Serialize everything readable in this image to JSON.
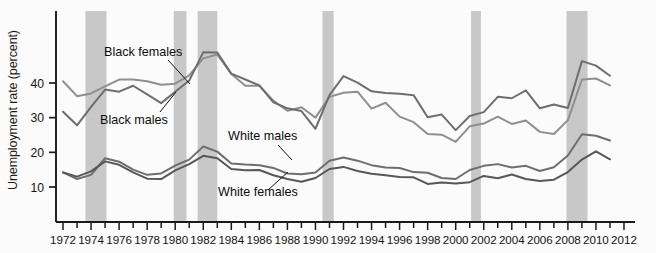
{
  "chart_data": {
    "type": "line",
    "title": "",
    "xlabel": "",
    "ylabel": "Unemployment rate (percent)",
    "xlim": [
      1971.5,
      2012.5
    ],
    "ylim": [
      0,
      50
    ],
    "yticks": [
      10,
      20,
      30,
      40
    ],
    "ytick_labels": [
      "10",
      "20",
      "30",
      "40"
    ],
    "xticks": [
      1972,
      1973,
      1974,
      1975,
      1976,
      1977,
      1978,
      1979,
      1980,
      1981,
      1982,
      1983,
      1984,
      1985,
      1986,
      1987,
      1988,
      1989,
      1990,
      1991,
      1992,
      1993,
      1994,
      1995,
      1996,
      1997,
      1998,
      1999,
      2000,
      2001,
      2002,
      2003,
      2004,
      2005,
      2006,
      2007,
      2008,
      2009,
      2010,
      2011,
      2012
    ],
    "xtick_labels": [
      "1972",
      "1974",
      "1976",
      "1978",
      "1980",
      "1982",
      "1984",
      "1986",
      "1988",
      "1990",
      "1992",
      "1994",
      "1996",
      "1998",
      "2000",
      "2002",
      "2004",
      "2006",
      "2008",
      "2010",
      "2012"
    ],
    "xtick_labeled_years": [
      1972,
      1974,
      1976,
      1978,
      1980,
      1982,
      1984,
      1986,
      1988,
      1990,
      1992,
      1994,
      1996,
      1998,
      2000,
      2002,
      2004,
      2006,
      2008,
      2010,
      2012
    ],
    "grid": false,
    "legend_position": "inline-annotations",
    "x": [
      1972,
      1973,
      1974,
      1975,
      1976,
      1977,
      1978,
      1979,
      1980,
      1981,
      1982,
      1983,
      1984,
      1985,
      1986,
      1987,
      1988,
      1989,
      1990,
      1991,
      1992,
      1993,
      1994,
      1995,
      1996,
      1997,
      1998,
      1999,
      2000,
      2001,
      2002,
      2003,
      2004,
      2005,
      2006,
      2007,
      2008,
      2009,
      2010,
      2011
    ],
    "series": [
      {
        "name": "Black females",
        "color": "#8f8f8f",
        "label_text": "Black females",
        "values": [
          40.5,
          36.2,
          37.0,
          39.0,
          41.0,
          41.0,
          40.5,
          39.5,
          39.8,
          42.2,
          47.1,
          48.2,
          42.6,
          39.2,
          39.2,
          34.9,
          32.0,
          33.0,
          30.0,
          36.0,
          37.2,
          37.5,
          32.6,
          34.3,
          30.3,
          28.7,
          25.3,
          25.1,
          23.0,
          27.5,
          28.3,
          30.3,
          28.2,
          29.2,
          25.9,
          25.3,
          29.3,
          41.0,
          41.3,
          39.3
        ]
      },
      {
        "name": "Black males",
        "color": "#6e6e6e",
        "label_text": "Black males",
        "values": [
          31.7,
          27.8,
          33.1,
          38.1,
          37.5,
          39.2,
          36.7,
          34.2,
          37.5,
          40.7,
          48.9,
          48.8,
          42.7,
          41.0,
          39.3,
          34.4,
          32.7,
          31.9,
          26.8,
          36.5,
          42.0,
          40.1,
          37.6,
          37.1,
          36.9,
          36.5,
          30.1,
          30.9,
          26.4,
          30.5,
          31.6,
          36.0,
          35.6,
          37.9,
          32.7,
          33.8,
          32.8,
          46.3,
          45.0,
          42.1
        ]
      },
      {
        "name": "White males",
        "color": "#6e6e6e",
        "label_text": "White males",
        "values": [
          14.2,
          12.3,
          13.5,
          18.3,
          17.3,
          15.0,
          13.5,
          13.9,
          16.2,
          17.9,
          21.7,
          20.2,
          16.8,
          16.5,
          16.3,
          15.5,
          13.9,
          13.7,
          14.2,
          17.6,
          18.5,
          17.6,
          16.3,
          15.6,
          15.5,
          14.3,
          14.1,
          12.6,
          12.3,
          14.9,
          16.1,
          16.6,
          15.6,
          16.1,
          14.6,
          15.7,
          19.1,
          25.2,
          24.8,
          23.4
        ]
      },
      {
        "name": "White females",
        "color": "#575757",
        "label_text": "White females",
        "values": [
          14.2,
          13.0,
          14.5,
          17.4,
          16.4,
          14.2,
          12.4,
          12.3,
          14.8,
          16.6,
          19.0,
          18.3,
          15.2,
          14.8,
          14.9,
          13.4,
          12.3,
          11.5,
          12.6,
          15.2,
          15.8,
          14.6,
          13.8,
          13.4,
          12.9,
          12.8,
          10.9,
          11.3,
          11.0,
          11.4,
          13.2,
          12.5,
          13.6,
          12.3,
          11.7,
          12.1,
          14.3,
          17.9,
          20.3,
          18.0
        ]
      }
    ],
    "recession_bands": [
      {
        "label": "1973-75 recession",
        "start": 1973.6,
        "end": 1975.1
      },
      {
        "label": "1980 recession",
        "start": 1979.9,
        "end": 1980.8
      },
      {
        "label": "1981-82 recession",
        "start": 1981.6,
        "end": 1983.0
      },
      {
        "label": "1990-91 recession",
        "start": 1990.5,
        "end": 1991.3
      },
      {
        "label": "2001 recession",
        "start": 2001.1,
        "end": 2001.8
      },
      {
        "label": "2007-09 recession",
        "start": 2007.9,
        "end": 2009.4
      }
    ],
    "band_color": "#c8c8c8",
    "axis_color": "#1a1a1a",
    "annotations": [
      {
        "name": "black-females-label",
        "text": "Black females",
        "x": 104,
        "y": 56,
        "leader": [
          [
            168,
            60
          ],
          [
            190,
            84
          ]
        ]
      },
      {
        "name": "black-males-label",
        "text": "Black males",
        "x": 100,
        "y": 124,
        "leader": [
          [
            160,
            112
          ],
          [
            176,
            92
          ]
        ]
      },
      {
        "name": "white-males-label",
        "text": "White males",
        "x": 228,
        "y": 140,
        "leader": [
          [
            278,
            145
          ],
          [
            292,
            160
          ]
        ]
      },
      {
        "name": "white-females-label",
        "text": "White females",
        "x": 218,
        "y": 196,
        "leader": [
          [
            268,
            190
          ],
          [
            288,
            172
          ]
        ]
      }
    ]
  }
}
